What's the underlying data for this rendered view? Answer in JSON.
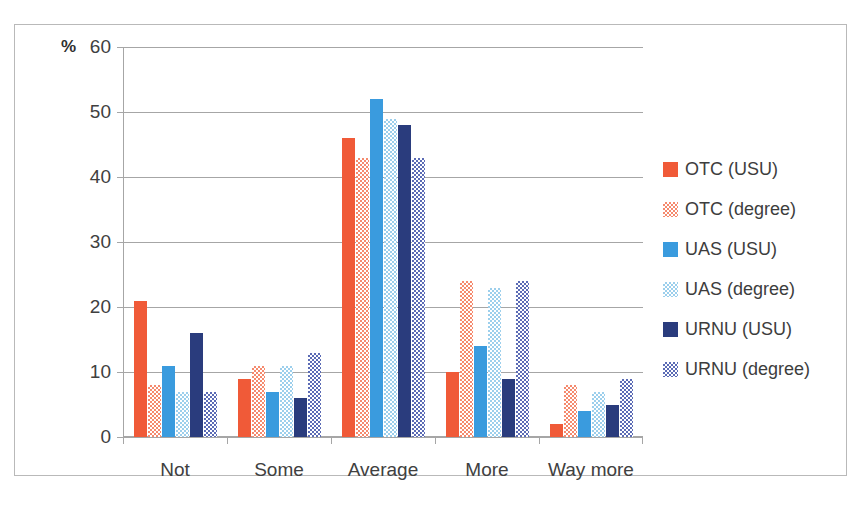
{
  "chart_data": {
    "type": "bar",
    "title": "",
    "xlabel": "",
    "ylabel": "%",
    "ylim": [
      0,
      60
    ],
    "yticks": [
      0,
      10,
      20,
      30,
      40,
      50,
      60
    ],
    "grid": true,
    "legend_position": "right",
    "categories": [
      "Not",
      "Some",
      "Average",
      "More",
      "Way more"
    ],
    "series": [
      {
        "name": "OTC (USU)",
        "key": "otc_usu",
        "color": "#F05A38",
        "pattern": "solid",
        "values": [
          21,
          9,
          46,
          10,
          2
        ]
      },
      {
        "name": "OTC (degree)",
        "key": "otc_deg",
        "color": "#F58A6E",
        "pattern": "checker",
        "values": [
          8,
          11,
          43,
          24,
          8
        ]
      },
      {
        "name": "UAS (USU)",
        "key": "uas_usu",
        "color": "#3A9BDE",
        "pattern": "solid",
        "values": [
          11,
          7,
          52,
          14,
          4
        ]
      },
      {
        "name": "UAS (degree)",
        "key": "uas_deg",
        "color": "#9CCFEC",
        "pattern": "checker",
        "values": [
          7,
          11,
          49,
          23,
          7
        ]
      },
      {
        "name": "URNU (USU)",
        "key": "urnu_usu",
        "color": "#2A3C7D",
        "pattern": "solid",
        "values": [
          16,
          6,
          48,
          9,
          5
        ]
      },
      {
        "name": "URNU (degree)",
        "key": "urnu_deg",
        "color": "#5B6BB5",
        "pattern": "checker",
        "values": [
          7,
          13,
          43,
          24,
          9
        ]
      }
    ]
  },
  "axis": {
    "y_title": "%",
    "tick_labels": [
      "60",
      "50",
      "40",
      "30",
      "20",
      "10",
      "0"
    ],
    "category_labels": [
      "Not",
      "Some",
      "Average",
      "More",
      "Way more"
    ]
  },
  "legend": {
    "items": [
      {
        "label": "OTC (USU)"
      },
      {
        "label": "OTC (degree)"
      },
      {
        "label": "UAS (USU)"
      },
      {
        "label": "UAS (degree)"
      },
      {
        "label": "URNU (USU)"
      },
      {
        "label": "URNU (degree)"
      }
    ]
  }
}
